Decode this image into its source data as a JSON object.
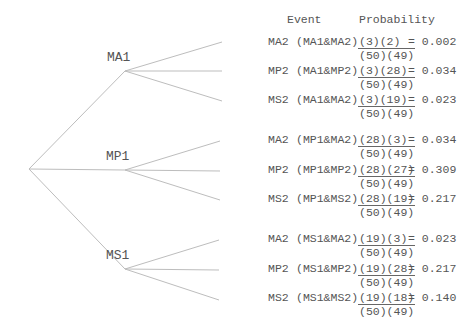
{
  "headers": {
    "event": "Event",
    "probability": "Probability"
  },
  "root": {
    "x": 29,
    "y": 169
  },
  "first_level": [
    {
      "label": "MA1",
      "x": 125,
      "y": 71,
      "rows": [
        {
          "event": "MA2",
          "pair": "(MA1&MA2)",
          "num": "(3)(2)",
          "den": "(50)(49)",
          "result": "= 0.002",
          "y": 42
        },
        {
          "event": "MP2",
          "pair": "(MA1&MP2)",
          "num": "(3)(28)",
          "den": "(50)(49)",
          "result": "= 0.034",
          "y": 71
        },
        {
          "event": "MS2",
          "pair": "(MA1&MA2)",
          "num": "(3)(19)",
          "den": "(50)(49)",
          "result": "= 0.023",
          "y": 100
        }
      ]
    },
    {
      "label": "MP1",
      "x": 125,
      "y": 170,
      "rows": [
        {
          "event": "MA2",
          "pair": "(MP1&MA2)",
          "num": "(28)(3)",
          "den": "(50)(49)",
          "result": "= 0.034",
          "y": 140
        },
        {
          "event": "MP2",
          "pair": "(MP1&MP2)",
          "num": "(28)(27)",
          "den": "(50)(49)",
          "result": "= 0.309",
          "y": 170
        },
        {
          "event": "MS2",
          "pair": "(MP1&MS2)",
          "num": "(28)(19)",
          "den": "(50)(49)",
          "result": "= 0.217",
          "y": 199
        }
      ]
    },
    {
      "label": "MS1",
      "x": 125,
      "y": 269,
      "rows": [
        {
          "event": "MA2",
          "pair": "(MS1&MA2)",
          "num": "(19)(3)",
          "den": "(50)(49)",
          "result": "= 0.023",
          "y": 239
        },
        {
          "event": "MP2",
          "pair": "(MS1&MP2)",
          "num": "(19)(28)",
          "den": "(50)(49)",
          "result": "= 0.217",
          "y": 269
        },
        {
          "event": "MS2",
          "pair": "(MS1&MS2)",
          "num": "(19)(18)",
          "den": "(50)(49)",
          "result": "= 0.140",
          "y": 298
        }
      ]
    }
  ]
}
